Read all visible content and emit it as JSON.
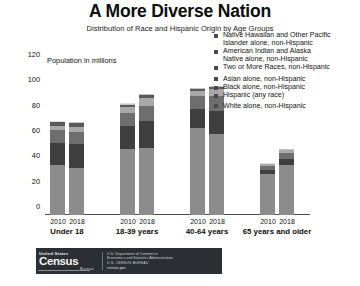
{
  "header": {
    "title": "A More Diverse Nation",
    "subtitle": "Distribution of Race and Hispanic Origin by Age Groups"
  },
  "chart_data": {
    "type": "bar",
    "subtype": "stacked-bar-grouped",
    "title": "A More Diverse Nation",
    "subtitle": "Distribution of Race and Hispanic Origin by Age Groups",
    "ylabel": "Population in millions",
    "xlabel": "",
    "ylim": [
      0,
      120
    ],
    "yticks": [
      0,
      20,
      40,
      60,
      80,
      100,
      120
    ],
    "ytick_labels": [
      "0",
      "20",
      "40",
      "60",
      "80",
      "100",
      "120"
    ],
    "grid": false,
    "legend_position": "top-right",
    "categories": [
      "Under 18",
      "18-39 years",
      "40-64 years",
      "65 years and older"
    ],
    "years": [
      "2010",
      "2018"
    ],
    "series": [
      {
        "name": "White alone, non-Hispanic",
        "color": "#8c8c8c",
        "values": {
          "Under 18": {
            "2010": 39.8,
            "2018": 37.2
          },
          "18-39 years": {
            "2010": 52.5,
            "2018": 53.0
          },
          "40-64 years": {
            "2010": 68.5,
            "2018": 64.0
          },
          "65 years and older": {
            "2010": 32.2,
            "2018": 39.6
          }
        }
      },
      {
        "name": "Hispanic (any race)",
        "color": "#3f3f3f",
        "values": {
          "Under 18": {
            "2010": 17.1,
            "2018": 18.8
          },
          "18-39 years": {
            "2010": 17.5,
            "2018": 21.5
          },
          "40-64 years": {
            "2010": 15.0,
            "2018": 18.5
          },
          "65 years and older": {
            "2010": 3.0,
            "2018": 4.7
          }
        }
      },
      {
        "name": "Black alone, non-Hispanic",
        "color": "#6e6e6e",
        "values": {
          "Under 18": {
            "2010": 10.1,
            "2018": 9.8
          },
          "18-39 years": {
            "2010": 10.6,
            "2018": 11.7
          },
          "40-64 years": {
            "2010": 10.3,
            "2018": 11.2
          },
          "65 years and older": {
            "2010": 3.4,
            "2018": 4.6
          }
        }
      },
      {
        "name": "Asian alone, non-Hispanic",
        "color": "#a8a8a8",
        "values": {
          "Under 18": {
            "2010": 3.3,
            "2018": 3.6
          },
          "18-39 years": {
            "2010": 4.8,
            "2018": 6.2
          },
          "40-64 years": {
            "2010": 4.5,
            "2018": 5.6
          },
          "65 years and older": {
            "2010": 1.3,
            "2018": 2.1
          }
        }
      },
      {
        "name": "Two or More Races, non-Hispanic",
        "color": "#5a5a5a",
        "values": {
          "Under 18": {
            "2010": 2.8,
            "2018": 3.2
          },
          "18-39 years": {
            "2010": 1.8,
            "2018": 2.4
          },
          "40-64 years": {
            "2010": 1.3,
            "2018": 1.7
          },
          "65 years and older": {
            "2010": 0.4,
            "2018": 0.7
          }
        }
      },
      {
        "name": "American Indian and Alaska Native alone, non-Hispanic",
        "color": "#c4c4c4",
        "values": {
          "Under 18": {
            "2010": 0.7,
            "2018": 0.6
          },
          "18-39 years": {
            "2010": 0.7,
            "2018": 0.8
          },
          "40-64 years": {
            "2010": 0.8,
            "2018": 0.9
          },
          "65 years and older": {
            "2010": 0.3,
            "2018": 0.4
          }
        }
      },
      {
        "name": "Native Hawaiian and Other Pacific Islander alone, non-Hispanic",
        "color": "#dedede",
        "values": {
          "Under 18": {
            "2010": 0.2,
            "2018": 0.2
          },
          "18-39 years": {
            "2010": 0.2,
            "2018": 0.3
          },
          "40-64 years": {
            "2010": 0.2,
            "2018": 0.2
          },
          "65 years and older": {
            "2010": 0.1,
            "2018": 0.1
          }
        }
      }
    ],
    "totals": {
      "Under 18": {
        "2010": 74.0,
        "2018": 73.4
      },
      "18-39 years": {
        "2010": 88.1,
        "2018": 95.9
      },
      "40-64 years": {
        "2010": 100.6,
        "2018": 102.1
      },
      "65 years and older": {
        "2010": 40.7,
        "2018": 52.2
      }
    }
  },
  "legend": {
    "items": [
      {
        "label_line1": "Native Hawaiian and Other Pacific",
        "label_line2": "Islander alone, non-Hispanic",
        "color": "#4a4a4a"
      },
      {
        "label_line1": "American Indian and Alaska",
        "label_line2": "Native alone, non-Hispanic",
        "color": "#4a4a4a"
      },
      {
        "label_line1": "Two or More Races, non-Hispanic",
        "label_line2": "",
        "color": "#4a4a4a"
      },
      {
        "label_line1": "Asian alone, non-Hispanic",
        "label_line2": "",
        "color": "#4a4a4a"
      },
      {
        "label_line1": "Black alone, non-Hispanic",
        "label_line2": "",
        "color": "#4a4a4a"
      },
      {
        "label_line1": "Hispanic (any race)",
        "label_line2": "",
        "color": "#4a4a4a"
      },
      {
        "label_line1": "White alone, non-Hispanic",
        "label_line2": "",
        "color": "#4a4a4a"
      }
    ]
  },
  "footer": {
    "logo_top": "United States",
    "logo_main": "Census",
    "logo_sub": "Bureau",
    "dept_line1": "U.S. Department of Commerce",
    "dept_line2": "Economics and Statistics Administration",
    "dept_line3": "U.S. CENSUS BUREAU",
    "dept_line4": "census.gov"
  }
}
